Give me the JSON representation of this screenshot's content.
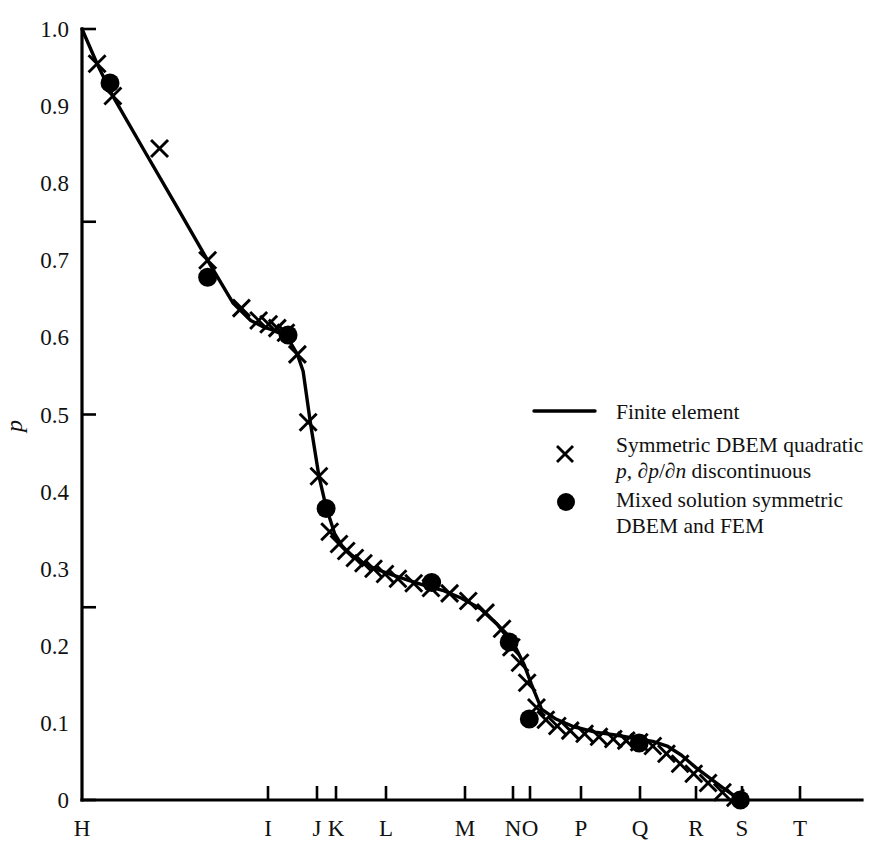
{
  "figure": {
    "background_color": "#ffffff",
    "ink_color": "#000000"
  },
  "axes": {
    "y_title": "p",
    "y_tick_labels": [
      "1.0",
      "0.9",
      "0.8",
      "0.7",
      "0.6",
      "0.5",
      "0.4",
      "0.3",
      "0.2",
      "0.1",
      "0"
    ],
    "y_tick_values": [
      1.0,
      0.9,
      0.8,
      0.7,
      0.6,
      0.5,
      0.4,
      0.3,
      0.2,
      0.1,
      0
    ],
    "y_major_ticks_drawn": [
      1.0,
      0.75,
      0.5,
      0.25,
      0
    ],
    "x_tick_labels": [
      "H",
      "I",
      "J",
      "K",
      "L",
      "M",
      "N",
      "O",
      "P",
      "Q",
      "R",
      "S",
      "T"
    ],
    "x_tick_pixel_positions": [
      82,
      268,
      317,
      336,
      386,
      465,
      513,
      530,
      581,
      640,
      696,
      742,
      800
    ]
  },
  "legend": {
    "entries": [
      {
        "marker": "line",
        "label_lines": [
          "Finite element"
        ]
      },
      {
        "marker": "cross",
        "label_lines": [
          "Symmetric DBEM quadratic",
          "p, ∂p/∂n discontinuous"
        ]
      },
      {
        "marker": "dot",
        "label_lines": [
          "Mixed solution symmetric",
          "DBEM and FEM"
        ]
      }
    ],
    "entry_1_label": "Finite element",
    "entry_2_line_1": "Symmetric DBEM quadratic",
    "entry_2_line_2_pre": "p",
    "entry_2_line_2_mid": ", ∂",
    "entry_2_line_2_p2": "p",
    "entry_2_line_2_slash": "/∂",
    "entry_2_line_2_n": "n",
    "entry_2_line_2_post": " discontinuous",
    "entry_3_line_1": "Mixed solution symmetric",
    "entry_3_line_2": "DBEM and FEM"
  },
  "chart_data": {
    "type": "line",
    "title": "",
    "xlabel": "",
    "ylabel": "p",
    "xlim": [
      0,
      13
    ],
    "ylim": [
      0,
      1.0
    ],
    "grid": false,
    "legend_position": "center-right",
    "x_categories": [
      "H",
      "I",
      "J",
      "K",
      "L",
      "M",
      "N",
      "O",
      "P",
      "Q",
      "R",
      "S",
      "T"
    ],
    "x_category_positions": [
      0.0,
      2.59,
      3.27,
      3.53,
      4.23,
      5.33,
      6.0,
      6.22,
      6.93,
      7.75,
      8.53,
      9.17,
      10.0
    ],
    "series": [
      {
        "name": "Finite element",
        "marker": "line",
        "x": [
          0.0,
          0.21,
          0.43,
          0.85,
          1.3,
          1.75,
          2.1,
          2.35,
          2.52,
          2.7,
          2.86,
          3.0,
          3.08,
          3.18,
          3.3,
          3.4,
          3.52,
          3.62,
          3.72,
          3.84,
          3.98,
          4.14,
          4.32,
          4.55,
          4.78,
          5.02,
          5.28,
          5.55,
          5.78,
          5.95,
          6.05,
          6.16,
          6.26,
          6.4,
          6.6,
          6.85,
          7.15,
          7.45,
          7.7,
          7.95,
          8.15,
          8.35,
          8.55,
          8.75,
          8.95,
          9.17
        ],
        "y": [
          1.0,
          0.955,
          0.913,
          0.845,
          0.773,
          0.7,
          0.645,
          0.622,
          0.614,
          0.608,
          0.6,
          0.578,
          0.556,
          0.49,
          0.42,
          0.38,
          0.345,
          0.33,
          0.32,
          0.312,
          0.304,
          0.298,
          0.292,
          0.285,
          0.278,
          0.272,
          0.262,
          0.248,
          0.228,
          0.208,
          0.196,
          0.175,
          0.15,
          0.118,
          0.105,
          0.095,
          0.088,
          0.084,
          0.08,
          0.076,
          0.07,
          0.058,
          0.042,
          0.028,
          0.014,
          0.0
        ]
      },
      {
        "name": "Symmetric DBEM quadratic p, dp/dn discontinuous",
        "marker": "cross",
        "x": [
          0.21,
          0.43,
          1.08,
          1.75,
          2.22,
          2.46,
          2.6,
          2.72,
          2.84,
          3.0,
          3.15,
          3.3,
          3.45,
          3.58,
          3.68,
          3.8,
          3.92,
          4.06,
          4.22,
          4.4,
          4.62,
          4.86,
          5.12,
          5.38,
          5.62,
          5.85,
          5.98,
          6.1,
          6.2,
          6.33,
          6.46,
          6.62,
          6.8,
          7.0,
          7.2,
          7.4,
          7.58,
          7.76,
          7.95,
          8.14,
          8.33,
          8.52,
          8.72,
          8.92,
          9.1
        ],
        "y": [
          0.955,
          0.913,
          0.845,
          0.7,
          0.638,
          0.622,
          0.617,
          0.612,
          0.606,
          0.578,
          0.49,
          0.42,
          0.348,
          0.332,
          0.323,
          0.314,
          0.307,
          0.3,
          0.293,
          0.287,
          0.281,
          0.275,
          0.268,
          0.258,
          0.243,
          0.222,
          0.198,
          0.178,
          0.152,
          0.12,
          0.104,
          0.096,
          0.09,
          0.086,
          0.082,
          0.079,
          0.077,
          0.075,
          0.07,
          0.06,
          0.047,
          0.034,
          0.022,
          0.01,
          0.003
        ]
      },
      {
        "name": "Mixed solution symmetric DBEM and FEM",
        "marker": "dot",
        "x": [
          0.39,
          1.75,
          2.87,
          3.4,
          4.87,
          5.95,
          6.23,
          7.76,
          9.17
        ],
        "y": [
          0.93,
          0.678,
          0.603,
          0.378,
          0.282,
          0.205,
          0.105,
          0.074,
          0.0
        ]
      }
    ]
  }
}
